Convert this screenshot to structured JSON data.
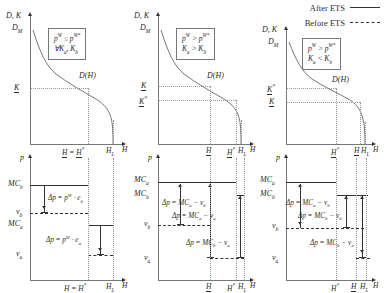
{
  "figure": {
    "domain": "economics-diagram"
  },
  "legend": {
    "position": "top-right",
    "entries": [
      {
        "label": "After ETS",
        "line_style": "solid"
      },
      {
        "label": "Before ETS",
        "line_style": "dash-dot"
      }
    ]
  },
  "top_panels": [
    {
      "id": "top-left",
      "y_axis_label": "D, K",
      "x_axis_label": "H",
      "curve_label": "D(H)",
      "y_ticks": [
        "D_M",
        "K"
      ],
      "y_tick_html": [
        "D<sub>M</sub>",
        "<span class='und'>K</span>"
      ],
      "x_ticks_html": [
        "<span class='und'>H</span> = <span class='und'>H</span><sup>*</sup>",
        "H<sub>L</sub>"
      ],
      "condition_lines_html": [
        "p<sup>W</sup> ≤ p<sup>W*</sup>",
        "∀K<sub>a</sub>, K<sub>b</sub>"
      ]
    },
    {
      "id": "top-middle",
      "y_axis_label": "D, K",
      "x_axis_label": "H",
      "curve_label": "D(H)",
      "y_ticks": [
        "D_M",
        "K",
        "K*"
      ],
      "y_tick_html": [
        "D<sub>M</sub>",
        "<span class='und'>K</span>",
        "<span class='und'>K</span><sup>*</sup>"
      ],
      "x_ticks_html": [
        "<span class='und'>H</span>",
        "<span class='und'>H</span><sup>*</sup>",
        "H<sub>L</sub>"
      ],
      "condition_lines_html": [
        "p<sup>W</sup> &gt; p<sup>W*</sup>",
        "K<sub>a</sub> &gt; K<sub>b</sub>"
      ]
    },
    {
      "id": "top-right",
      "y_axis_label": "D, K",
      "x_axis_label": "H",
      "curve_label": "D(H)",
      "y_ticks": [
        "D_M",
        "K*",
        "K"
      ],
      "y_tick_html": [
        "D<sub>M</sub>",
        "<span class='und'>K</span><sup>*</sup>",
        "<span class='und'>K</span>"
      ],
      "x_ticks_html": [
        "<span class='und'>H</span><sup>*</sup>",
        "<span class='und'>H</span>",
        "H<sub>L</sub>"
      ],
      "condition_lines_html": [
        "p<sup>W</sup> &gt; p<sup>W*</sup>",
        "K<sub>a</sub> &lt; K<sub>b</sub>"
      ]
    }
  ],
  "bottom_panels": [
    {
      "id": "bottom-left",
      "y_axis_label": "p",
      "x_axis_label": "H",
      "y_tick_html": [
        "MC<sub>b</sub>",
        "v<sub>b</sub>",
        "MC<sub>a</sub>",
        "v<sub>a</sub>"
      ],
      "x_ticks_html": [
        "H = <span class='und'>H</span><sup>*</sup>",
        "H<sub>L</sub>"
      ],
      "delta_labels_html": [
        "Δp = p<sup>W</sup> · e<sub>b</sub>",
        "Δp = p<sup>W</sup> · e<sub>a</sub>"
      ]
    },
    {
      "id": "bottom-middle",
      "y_axis_label": "p",
      "x_axis_label": "H",
      "y_tick_html": [
        "MC<sub>a</sub>",
        "MC<sub>b</sub>",
        "v<sub>b</sub>",
        "v<sub>a</sub>"
      ],
      "x_ticks_html": [
        "<span class='und'>H</span>",
        "<span class='und'>H</span><sup>*</sup>",
        "H<sub>L</sub>"
      ],
      "delta_labels_html": [
        "Δp = MC<sub>a</sub> − v<sub>b</sub>",
        "Δp = MC<sub>a</sub> − v<sub>a</sub>",
        "Δp = MC<sub>b</sub> − v<sub>a</sub>"
      ]
    },
    {
      "id": "bottom-right",
      "y_axis_label": "p",
      "x_axis_label": "H",
      "y_tick_html": [
        "MC<sub>a</sub>",
        "MC<sub>b</sub>",
        "v<sub>b</sub>",
        "v<sub>a</sub>"
      ],
      "x_ticks_html": [
        "<span class='und'>H</span><sup>*</sup>",
        "<span class='und'>H</span>",
        "H<sub>L</sub>"
      ],
      "delta_labels_html": [
        "Δp = MC<sub>a</sub> − v<sub>b</sub>",
        "Δp = MC<sub>b</sub> − v<sub>b</sub>",
        "Δp = MC<sub>b</sub> − v<sub>a</sub>"
      ]
    }
  ],
  "colors": {
    "line": "#333333",
    "axis": "#777777",
    "guide": "#999999",
    "text": "#2b2b2b",
    "background": "#ffffff"
  }
}
